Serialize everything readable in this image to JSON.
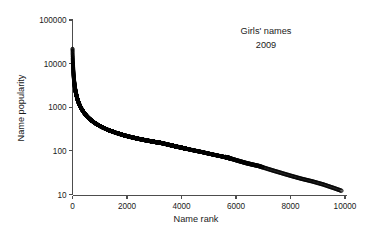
{
  "chart_data": {
    "type": "scatter",
    "title": "",
    "annotations": [
      {
        "text": "Girls' names",
        "x": 7600,
        "y": 45000
      },
      {
        "text": "2009",
        "x": 7600,
        "y": 27000
      }
    ],
    "xlabel": "Name rank",
    "ylabel": "Name popularity",
    "xlim": [
      0,
      10300
    ],
    "ylim": [
      10,
      100000
    ],
    "yscale": "log",
    "xscale": "linear",
    "grid": false,
    "legend": null,
    "xticks": [
      0,
      2000,
      4000,
      6000,
      8000,
      10000
    ],
    "xtick_labels": [
      "0",
      "2000",
      "4000",
      "6000",
      "8000",
      "10000"
    ],
    "yticks": [
      10,
      100,
      1000,
      10000,
      100000
    ],
    "ytick_labels": [
      "10",
      "100",
      "1000",
      "10000",
      "100000"
    ],
    "marker": "open-circle",
    "marker_color": "#000000",
    "series": [
      {
        "name": "Girls' name popularity 2009",
        "x": [
          1,
          2,
          3,
          4,
          5,
          6,
          7,
          8,
          9,
          10,
          12,
          14,
          17,
          20,
          24,
          29,
          35,
          42,
          50,
          60,
          72,
          86,
          103,
          124,
          149,
          178,
          214,
          257,
          308,
          370,
          444,
          533,
          639,
          767,
          920,
          1104,
          1325,
          1590,
          1908,
          2290,
          2748,
          3297,
          3957,
          4748,
          5698,
          6400,
          6838,
          7200,
          7600,
          8000,
          8400,
          8800,
          9200,
          9600,
          9900
        ],
        "y": [
          22000,
          20800,
          19500,
          18200,
          17000,
          16000,
          15000,
          14200,
          13400,
          12800,
          11800,
          10900,
          9900,
          9000,
          8000,
          7000,
          6100,
          5300,
          4600,
          3950,
          3400,
          2900,
          2500,
          2150,
          1830,
          1560,
          1330,
          1140,
          980,
          840,
          720,
          620,
          535,
          460,
          398,
          345,
          299,
          260,
          226,
          197,
          172,
          150,
          120,
          94,
          70,
          52,
          45,
          38,
          32,
          27,
          23,
          20,
          17,
          14,
          12
        ]
      }
    ]
  },
  "axes": {
    "xlabel": "Name rank",
    "ylabel": "Name popularity"
  },
  "annotation_lines": {
    "line1": "Girls' names",
    "line2": "2009"
  },
  "colors": {
    "marker": "#000000",
    "axis": "#4d4d4d",
    "text": "#1a1a1a",
    "background": "#ffffff"
  }
}
